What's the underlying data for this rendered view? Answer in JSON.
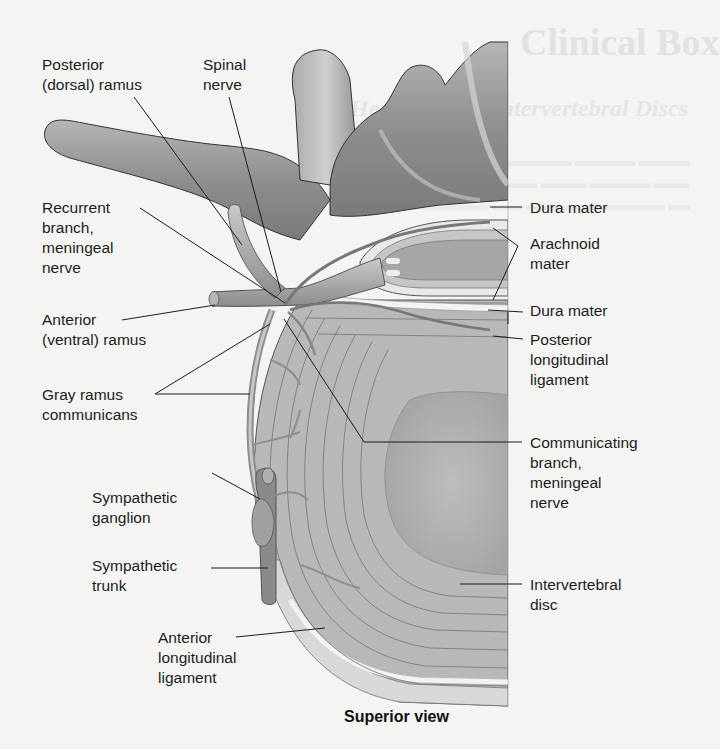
{
  "figure": {
    "view_caption": "Superior view",
    "background_color": "#f4f4f3",
    "bone_color": "#9a9a9a",
    "disc_color": "#b9b9b9",
    "line_color": "#1d1d1d"
  },
  "labels": {
    "posterior_ramus": "Posterior\n(dorsal) ramus",
    "spinal_nerve": "Spinal\nnerve",
    "recurrent_branch": "Recurrent\nbranch,\nmeningeal\nnerve",
    "anterior_ramus": "Anterior\n(ventral) ramus",
    "gray_ramus": "Gray ramus\ncommunicans",
    "sympathetic_ganglion": "Sympathetic\nganglion",
    "sympathetic_trunk": "Sympathetic\ntrunk",
    "anterior_longitudinal_ligament": "Anterior\nlongitudinal\nligament",
    "dura_mater_top": "Dura mater",
    "arachnoid_mater": "Arachnoid\nmater",
    "dura_mater_bottom": "Dura mater",
    "posterior_longitudinal_ligament": "Posterior\nlongitudinal\nligament",
    "communicating_branch": "Communicating\nbranch,\nmeningeal\nnerve",
    "intervertebral_disc": "Intervertebral\ndisc"
  },
  "bleed_through": {
    "title": "Clinical Box",
    "subtitle": "Herniation of Intervertebral Discs"
  }
}
